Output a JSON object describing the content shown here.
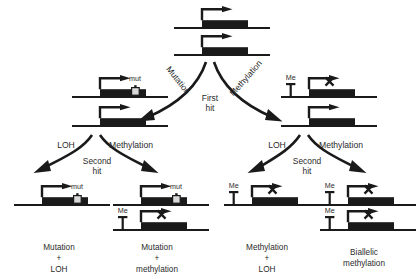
{
  "diagram": {
    "type": "flow-diagram",
    "background_color": "#ffffff",
    "ink_color": "#1a1a1a",
    "gene_box_color": "#1a1a1a",
    "mut_marker_color": "#d9d9d9"
  },
  "top": {
    "node_name": "wild-type-biallelic-gene",
    "allele_count": 2,
    "alleles": [
      {
        "label": "",
        "silenced": false,
        "marker": "none"
      },
      {
        "label": "",
        "silenced": false,
        "marker": "none"
      }
    ]
  },
  "first_hit": {
    "center_label_line1": "First",
    "center_label_line2": "hit",
    "left_branch_label": "Mutation",
    "right_branch_label": "Methylation"
  },
  "second_hit": {
    "center_label_line1": "Second",
    "center_label_line2": "hit",
    "left_group": {
      "left_branch_label": "LOH",
      "right_branch_label": "Methylation"
    },
    "right_group": {
      "left_branch_label": "LOH",
      "right_branch_label": "Methylation"
    }
  },
  "intermediates": {
    "left": {
      "node_name": "mutated-allele-pair",
      "alleles": [
        {
          "marker": "mut",
          "marker_label": "mut",
          "silenced": false
        },
        {
          "marker": "none",
          "marker_label": "",
          "silenced": false
        }
      ]
    },
    "right": {
      "node_name": "methylated-allele-pair",
      "alleles": [
        {
          "marker": "Me",
          "marker_label": "Me",
          "silenced": true
        },
        {
          "marker": "none",
          "marker_label": "",
          "silenced": false
        }
      ]
    }
  },
  "outcomes": [
    {
      "id": "mutation-loh",
      "caption_line1": "Mutation",
      "caption_plus": "+",
      "caption_line2": "LOH",
      "alleles": [
        {
          "marker": "mut",
          "marker_label": "mut",
          "silenced": false
        }
      ]
    },
    {
      "id": "mutation-methylation",
      "caption_line1": "Mutation",
      "caption_plus": "+",
      "caption_line2": "methylation",
      "alleles": [
        {
          "marker": "mut",
          "marker_label": "mut",
          "silenced": false
        },
        {
          "marker": "Me",
          "marker_label": "Me",
          "silenced": true
        }
      ]
    },
    {
      "id": "methylation-loh",
      "caption_line1": "Methylation",
      "caption_plus": "+",
      "caption_line2": "LOH",
      "alleles": [
        {
          "marker": "Me",
          "marker_label": "Me",
          "silenced": true
        }
      ]
    },
    {
      "id": "biallelic-methylation",
      "caption_line1": "Biallelic",
      "caption_plus": "",
      "caption_line2": "methylation",
      "alleles": [
        {
          "marker": "Me",
          "marker_label": "Me",
          "silenced": true
        },
        {
          "marker": "Me",
          "marker_label": "Me",
          "silenced": true
        }
      ]
    }
  ]
}
